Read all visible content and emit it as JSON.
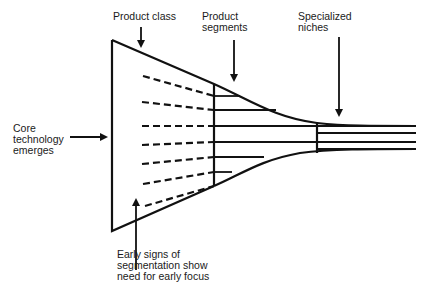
{
  "diagram": {
    "title": "",
    "labels": {
      "product_class": "Product class",
      "product_segments": [
        "Product",
        "segments"
      ],
      "specialized_niches": [
        "Specialized",
        "niches"
      ],
      "core_technology": [
        "Core",
        "technology",
        "emerges"
      ],
      "early_signs": [
        "Early signs of",
        "segmentation show",
        "need for early focus"
      ]
    },
    "stages": [
      {
        "name": "Core technology emerges"
      },
      {
        "name": "Product class"
      },
      {
        "name": "Product segments",
        "line_count": 6
      },
      {
        "name": "Specialized niches",
        "line_count": 4
      }
    ],
    "dashed_lines_count": 7,
    "colors": {
      "ink": "#111111",
      "background": "#ffffff"
    }
  }
}
